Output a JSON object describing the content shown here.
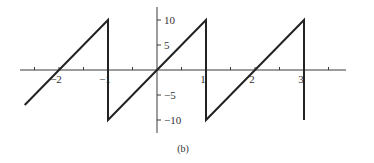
{
  "chart_data": {
    "type": "line",
    "title": "",
    "caption": "(b)",
    "xlabel": "",
    "ylabel": "",
    "xlim": [
      -2.8,
      3.8
    ],
    "ylim": [
      -12.5,
      12.5
    ],
    "grid": false,
    "legend": null,
    "x_ticks": [
      -2.5,
      -2,
      -1.5,
      -1,
      -0.5,
      0,
      0.5,
      1,
      1.5,
      2,
      2.5,
      3,
      3.5
    ],
    "x_tick_labels": [
      {
        "value": -2,
        "label": "−2"
      },
      {
        "value": -1,
        "label": "−1"
      },
      {
        "value": 1,
        "label": "1"
      },
      {
        "value": 2,
        "label": "2"
      },
      {
        "value": 3,
        "label": "3"
      }
    ],
    "y_ticks": [
      -10,
      -5,
      5,
      10
    ],
    "y_tick_labels": [
      {
        "value": 10,
        "label": "10"
      },
      {
        "value": 5,
        "label": "5"
      },
      {
        "value": -5,
        "label": "−5"
      },
      {
        "value": -10,
        "label": "−10"
      }
    ],
    "series": [
      {
        "name": "sawtooth",
        "description": "f(x) = 10x on (-1, 1), periodic with period 2",
        "x": [
          -2.7,
          -1,
          -1,
          1,
          1,
          3,
          3
        ],
        "y": [
          -7,
          10,
          -10,
          10,
          -10,
          10,
          -10
        ]
      }
    ]
  }
}
